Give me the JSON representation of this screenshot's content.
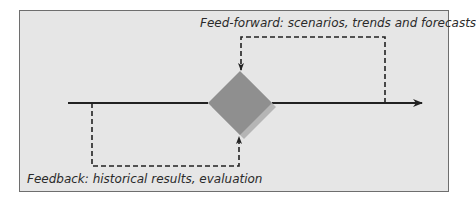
{
  "diagram": {
    "feed_forward_label": "Feed-forward: scenarios, trends and forecasts",
    "feedback_label": "Feedback: historical results, evaluation",
    "colors": {
      "background": "#e6e6e6",
      "border": "#6e6e6e",
      "line": "#222222",
      "diamond": "#8f8f8f",
      "diamond_shadow": "#b5b5b5"
    },
    "nodes": [
      {
        "id": "decision-diamond",
        "shape": "diamond",
        "center": [
          240,
          103
        ]
      }
    ]
  }
}
